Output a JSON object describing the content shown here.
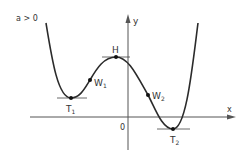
{
  "diagram": {
    "condition_label": "a > 0",
    "axes": {
      "x_label": "x",
      "y_label": "y",
      "origin_label": "0"
    },
    "points": {
      "high": "H",
      "low1": "T",
      "low1_sub": "1",
      "low2": "T",
      "low2_sub": "2",
      "inflection1": "W",
      "inflection1_sub": "1",
      "inflection2": "W",
      "inflection2_sub": "2"
    },
    "colors": {
      "curve": "#2b2b2b",
      "axis": "#555555",
      "text": "#333333",
      "background": "#ffffff"
    }
  }
}
